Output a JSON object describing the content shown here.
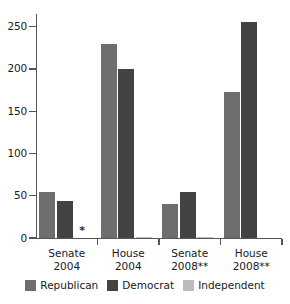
{
  "chart_data": {
    "type": "bar",
    "title": "",
    "subtitle": "",
    "xlabel": "",
    "ylabel": "",
    "categories": [
      "Senate\n2004",
      "House\n2004",
      "Senate\n2008**",
      "House\n2008**"
    ],
    "category_lines": [
      {
        "line1": "Senate",
        "line2": "2004"
      },
      {
        "line1": "House",
        "line2": "2004"
      },
      {
        "line1": "Senate",
        "line2": "2008**"
      },
      {
        "line1": "House",
        "line2": "2008**"
      }
    ],
    "series": [
      {
        "name": "Republican",
        "color": "#6e6e6e",
        "values": [
          55,
          230,
          40,
          173
        ]
      },
      {
        "name": "Democrat",
        "color": "#434343",
        "values": [
          44,
          200,
          55,
          255
        ]
      },
      {
        "name": "Independent",
        "color": "#bcbcbc",
        "values": [
          0,
          1,
          1,
          0
        ]
      }
    ],
    "ylim": [
      0,
      265
    ],
    "yticks": [
      0,
      50,
      100,
      150,
      200,
      250
    ],
    "ytick_labels": [
      "0",
      "50",
      "100",
      "150",
      "200",
      "250"
    ],
    "grid": false,
    "legend_position": "bottom",
    "annotations": [
      {
        "text": "*",
        "series": "Independent",
        "category": "Senate\n2004",
        "value": 0
      }
    ]
  },
  "legend": {
    "items": [
      {
        "label": "Republican",
        "color": "#6e6e6e"
      },
      {
        "label": "Democrat",
        "color": "#434343"
      },
      {
        "label": "Independent",
        "color": "#bcbcbc"
      }
    ]
  }
}
